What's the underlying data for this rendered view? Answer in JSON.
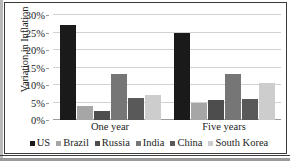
{
  "chart_data": {
    "type": "bar",
    "title": "",
    "xlabel": "",
    "ylabel": "Variation in Inflation",
    "categories": [
      "One year",
      "Five years"
    ],
    "ylim": [
      0,
      30
    ],
    "ytick_values": [
      0,
      5,
      10,
      15,
      20,
      25,
      30
    ],
    "ytick_labels": [
      "0%",
      "5%",
      "10%",
      "15%",
      "20%",
      "25%",
      "30%"
    ],
    "grid": true,
    "legend_position": "bottom",
    "series": [
      {
        "name": "US",
        "color": "#1a1a1a",
        "values": [
          27.2,
          25.0
        ]
      },
      {
        "name": "Brazil",
        "color": "#a6a6a6",
        "values": [
          4.1,
          5.0
        ]
      },
      {
        "name": "Russia",
        "color": "#4d4d4d",
        "values": [
          2.5,
          5.7
        ]
      },
      {
        "name": "India",
        "color": "#767676",
        "values": [
          13.1,
          13.1
        ]
      },
      {
        "name": "China",
        "color": "#595959",
        "values": [
          6.3,
          5.9
        ]
      },
      {
        "name": "South Korea",
        "color": "#cdcdcd",
        "values": [
          7.2,
          10.5
        ]
      }
    ]
  }
}
